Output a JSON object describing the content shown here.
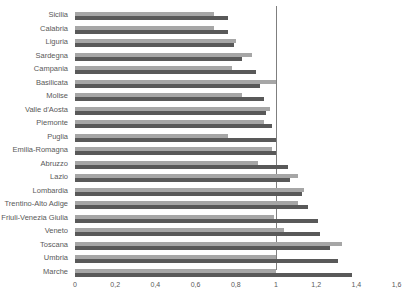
{
  "chart_data": {
    "type": "bar",
    "orientation": "horizontal",
    "title": "",
    "xlabel": "",
    "ylabel": "",
    "xlim": [
      0,
      1.6
    ],
    "x_ticks": [
      "0",
      "0,2",
      "0,4",
      "0,6",
      "0,8",
      "1",
      "1,2",
      "1,4",
      "1,6"
    ],
    "grid": false,
    "reference_line": {
      "x": 1,
      "color": "#7f7f7f"
    },
    "legend": null,
    "categories": [
      "Sicilia",
      "Calabria",
      "Liguria",
      "Sardegna",
      "Campania",
      "Basilicata",
      "Molise",
      "Valle d'Aosta",
      "Piemonte",
      "Puglia",
      "Emilia-Romagna",
      "Abruzzo",
      "Lazio",
      "Lombardia",
      "Trentino-Alto Adige",
      "Friuli-Venezia Giulia",
      "Veneto",
      "Toscana",
      "Umbria",
      "Marche"
    ],
    "series": [
      {
        "name": "series-1",
        "color": "#a6a6a6",
        "values": [
          0.69,
          0.69,
          0.8,
          0.88,
          0.78,
          1.0,
          0.83,
          0.97,
          0.94,
          0.76,
          0.98,
          0.91,
          1.11,
          1.14,
          1.11,
          0.99,
          1.04,
          1.33,
          1.0,
          1.0
        ]
      },
      {
        "name": "series-2",
        "color": "#595959",
        "values": [
          0.76,
          0.76,
          0.79,
          0.83,
          0.9,
          0.92,
          0.94,
          0.95,
          0.98,
          1.0,
          1.0,
          1.06,
          1.07,
          1.13,
          1.16,
          1.21,
          1.22,
          1.27,
          1.31,
          1.38
        ]
      }
    ]
  }
}
